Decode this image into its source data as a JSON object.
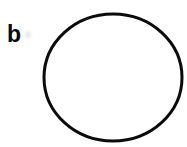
{
  "figure": {
    "panel_label": "b",
    "background": "#ffffff"
  },
  "circle": {
    "cx": 113,
    "cy": 77.5,
    "rx": 69,
    "ry": 63.5,
    "stroke": "#0b0b0b",
    "stroke_width": 3,
    "fill": "none"
  },
  "artifact": {
    "color": "#e6e6e6"
  }
}
